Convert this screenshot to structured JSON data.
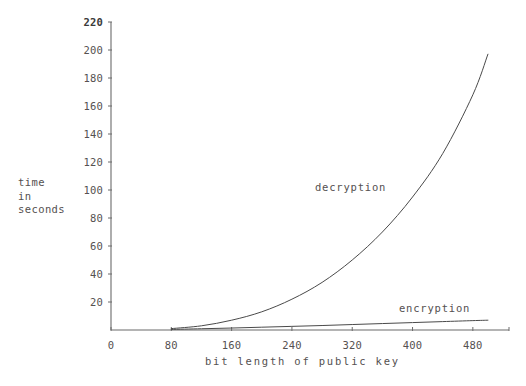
{
  "chart_data": {
    "type": "line",
    "title": "",
    "xlabel": "bit length of public key",
    "ylabel": "time\nin\nseconds",
    "ylabel_lines": [
      "time",
      "in",
      "seconds"
    ],
    "xlim": [
      0,
      520
    ],
    "ylim": [
      0,
      220
    ],
    "xticks": [
      0,
      80,
      160,
      240,
      320,
      400,
      480
    ],
    "xtick_labels": [
      "0",
      "80",
      "160",
      "240",
      "320",
      "400",
      "480"
    ],
    "yticks": [
      0,
      20,
      40,
      60,
      80,
      100,
      120,
      140,
      160,
      180,
      200,
      220
    ],
    "ytick_labels": [
      "0",
      "20",
      "40",
      "60",
      "80",
      "100",
      "120",
      "140",
      "160",
      "180",
      "200",
      "220"
    ],
    "grid": false,
    "legend": "inline-annotations",
    "line_color": "#4a4a4a",
    "axis_color": "#6b6b6b",
    "series": [
      {
        "name": "decryption",
        "label": "decryption",
        "x": [
          80,
          120,
          160,
          200,
          240,
          280,
          320,
          360,
          400,
          440,
          480,
          500
        ],
        "values": [
          1,
          3,
          7,
          13,
          22,
          34,
          50,
          70,
          95,
          126,
          168,
          197
        ]
      },
      {
        "name": "encryption",
        "label": "encryption",
        "x": [
          80,
          120,
          160,
          200,
          240,
          280,
          320,
          360,
          400,
          440,
          480,
          500
        ],
        "values": [
          0.4,
          0.9,
          1.4,
          2.0,
          2.6,
          3.2,
          3.9,
          4.6,
          5.3,
          6.0,
          6.7,
          7.0
        ]
      }
    ],
    "annotations": [
      {
        "name": "decryption",
        "text": "decryption"
      },
      {
        "name": "encryption",
        "text": "encryption"
      }
    ]
  },
  "plot_geometry": {
    "left": 111,
    "right": 503,
    "bottom": 330,
    "top": 22
  }
}
